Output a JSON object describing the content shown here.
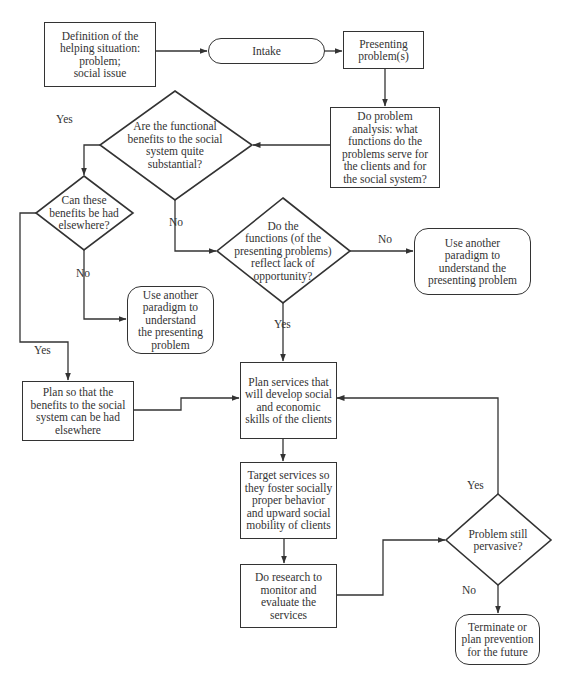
{
  "diagram": {
    "type": "flowchart",
    "nodes": {
      "definition": {
        "shape": "rectangle",
        "text": "Definition of the\nhelping situation:\nproblem;\nsocial issue"
      },
      "intake": {
        "shape": "terminator",
        "text": "Intake"
      },
      "presenting": {
        "shape": "rectangle",
        "text": "Presenting\nproblem(s)"
      },
      "analysis": {
        "shape": "rectangle",
        "text": "Do problem\nanalysis: what\nfunctions do the\nproblems serve for\nthe clients and for\nthe social system?"
      },
      "q_substantial": {
        "shape": "diamond",
        "text": "Are the functional\nbenefits to the social\nsystem quite\nsubstantial?"
      },
      "q_elsewhere": {
        "shape": "diamond",
        "text": "Can these\nbenefits be had\nelsewhere?"
      },
      "q_opportunity": {
        "shape": "diamond",
        "text": "Do the\nfunctions (of the\npresenting problems)\nreflect lack of\nopportunity?"
      },
      "paradigm_right": {
        "shape": "rounded",
        "text": "Use another\nparadigm to\nunderstand the\npresenting problem"
      },
      "paradigm_left": {
        "shape": "rounded",
        "text": "Use another\nparadigm to\nunderstand\nthe presenting\nproblem"
      },
      "plan_elsewhere": {
        "shape": "rectangle",
        "text": "Plan so that the\nbenefits to the social\nsystem can be had\nelsewhere"
      },
      "plan_services": {
        "shape": "rectangle",
        "text": "Plan services that\nwill develop social\nand economic\nskills of the clients"
      },
      "target_services": {
        "shape": "rectangle",
        "text": "Target services so\nthey foster socially\nproper behavior\nand upward social\nmobility of clients"
      },
      "research": {
        "shape": "rectangle",
        "text": "Do research to\nmonitor and\nevaluate the\nservices"
      },
      "q_pervasive": {
        "shape": "diamond",
        "text": "Problem still\npervasive?"
      },
      "terminate": {
        "shape": "rounded",
        "text": "Terminate or\nplan prevention\nfor the future"
      }
    },
    "edge_labels": {
      "substantial_yes": "Yes",
      "substantial_no": "No",
      "elsewhere_no": "No",
      "elsewhere_yes": "Yes",
      "opportunity_no": "No",
      "opportunity_yes": "Yes",
      "pervasive_yes": "Yes",
      "pervasive_no": "No"
    },
    "edges": [
      {
        "from": "definition",
        "to": "intake"
      },
      {
        "from": "intake",
        "to": "presenting"
      },
      {
        "from": "presenting",
        "to": "analysis"
      },
      {
        "from": "analysis",
        "to": "q_substantial"
      },
      {
        "from": "q_substantial",
        "to": "q_elsewhere",
        "label": "Yes"
      },
      {
        "from": "q_substantial",
        "to": "q_opportunity",
        "label": "No"
      },
      {
        "from": "q_elsewhere",
        "to": "paradigm_left",
        "label": "No"
      },
      {
        "from": "q_elsewhere",
        "to": "plan_elsewhere",
        "label": "Yes"
      },
      {
        "from": "q_opportunity",
        "to": "paradigm_right",
        "label": "No"
      },
      {
        "from": "q_opportunity",
        "to": "plan_services",
        "label": "Yes"
      },
      {
        "from": "plan_elsewhere",
        "to": "plan_services"
      },
      {
        "from": "plan_services",
        "to": "target_services"
      },
      {
        "from": "target_services",
        "to": "research"
      },
      {
        "from": "research",
        "to": "q_pervasive"
      },
      {
        "from": "q_pervasive",
        "to": "plan_services",
        "label": "Yes"
      },
      {
        "from": "q_pervasive",
        "to": "terminate",
        "label": "No"
      }
    ]
  }
}
